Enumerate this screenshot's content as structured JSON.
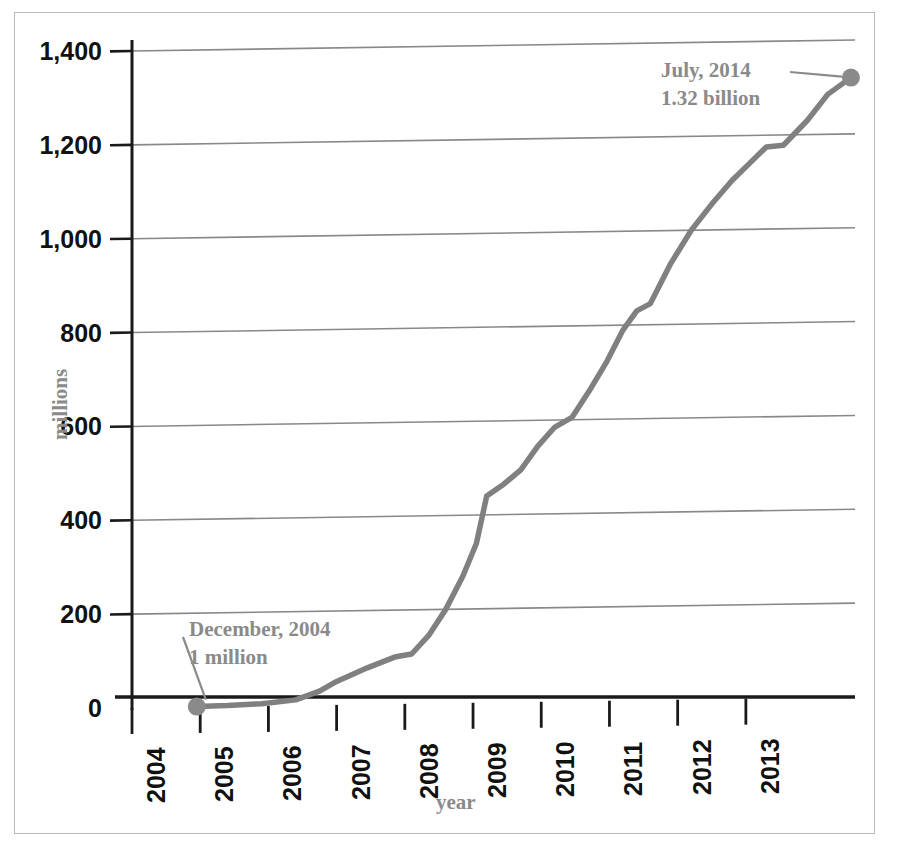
{
  "chart_data": {
    "type": "line",
    "title": "",
    "subtitle": "",
    "xlabel": "year",
    "ylabel": "millions",
    "xlim": [
      2004,
      2014.6
    ],
    "ylim": [
      0,
      1400
    ],
    "grid": "horizontal",
    "legend": "none",
    "y_ticks": [
      0,
      200,
      400,
      600,
      800,
      1000,
      1200,
      1400
    ],
    "y_tick_labels": [
      "0",
      "200",
      "400",
      "600",
      "800",
      "1,000",
      "1,200",
      "1,400"
    ],
    "x_ticks": [
      2004,
      2005,
      2006,
      2007,
      2008,
      2009,
      2010,
      2011,
      2012,
      2013
    ],
    "x_tick_labels": [
      "2004",
      "2005",
      "2006",
      "2007",
      "2008",
      "2009",
      "2010",
      "2011",
      "2012",
      "2013"
    ],
    "series": [
      {
        "name": "users",
        "color": "#808080",
        "x": [
          2004.95,
          2005.4,
          2005.9,
          2006.4,
          2006.75,
          2007.0,
          2007.45,
          2007.85,
          2008.1,
          2008.35,
          2008.6,
          2008.85,
          2009.05,
          2009.2,
          2009.45,
          2009.7,
          2009.95,
          2010.2,
          2010.45,
          2010.7,
          2010.95,
          2011.2,
          2011.4,
          2011.6,
          2011.9,
          2012.2,
          2012.5,
          2012.8,
          2013.05,
          2013.3,
          2013.55,
          2013.9,
          2014.2,
          2014.54
        ],
        "y": [
          1,
          2,
          5,
          12,
          30,
          50,
          78,
          100,
          106,
          145,
          200,
          270,
          340,
          440,
          465,
          495,
          545,
          585,
          605,
          660,
          720,
          790,
          830,
          845,
          930,
          1000,
          1055,
          1105,
          1140,
          1175,
          1178,
          1230,
          1285,
          1320
        ]
      }
    ],
    "annotated_points": [
      {
        "id": "start",
        "label_line1": "December, 2004",
        "label_line2": "1 million",
        "x": 2004.95,
        "y": 1,
        "marker_color": "#8a8a8a"
      },
      {
        "id": "end",
        "label_line1": "July, 2014",
        "label_line2": "1.32 billion",
        "x": 2014.54,
        "y": 1320,
        "marker_color": "#8a8a8a"
      }
    ],
    "colors": {
      "line": "#808080",
      "grid": "#888888",
      "axis": "#1a1a1a",
      "tick_text": "#111111",
      "annotation_text": "#8a8a8a",
      "axis_title": "#8a8a8a",
      "page_border": "#b9b9b9",
      "background": "#ffffff"
    }
  },
  "geometry": {
    "plot_left": 132,
    "plot_right": 855,
    "plot_top": 40,
    "plot_bottom": 697,
    "px_per_year": 77.5
  }
}
